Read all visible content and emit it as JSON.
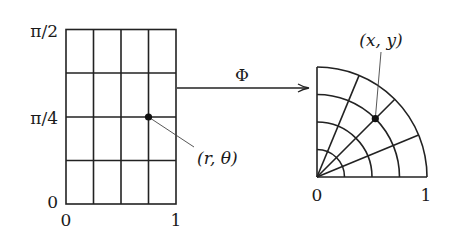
{
  "diagram": {
    "left_domain": {
      "description": "rectangular (r, theta) grid",
      "grid": {
        "columns": 4,
        "rows": 4
      },
      "x_axis_labels": {
        "start": "0",
        "end": "1"
      },
      "y_axis_labels": {
        "bottom": "0",
        "middle": "π/4",
        "top": "π/2"
      },
      "point_label": "(r, θ)",
      "point": {
        "r": 0.75,
        "theta": "π/4"
      }
    },
    "map": {
      "label": "Φ"
    },
    "right_domain": {
      "description": "quarter disk polar grid",
      "radial_divisions": 4,
      "angular_divisions": 4,
      "x_axis_labels": {
        "start": "0",
        "end": "1"
      },
      "point_label": "(x, y)"
    },
    "colors": {
      "line": "#222222",
      "background": "#ffffff",
      "text": "#1a1a1a"
    }
  }
}
